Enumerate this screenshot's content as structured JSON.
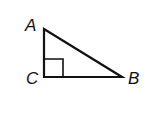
{
  "diagram": {
    "type": "right-triangle",
    "vertices": {
      "A": {
        "label": "A",
        "x": 44,
        "y": 29
      },
      "C": {
        "label": "C",
        "x": 44,
        "y": 77
      },
      "B": {
        "label": "B",
        "x": 122,
        "y": 77
      }
    },
    "right_angle_at": "C",
    "stroke_color": "#111111",
    "labels": {
      "A": "A",
      "B": "B",
      "C": "C"
    }
  }
}
